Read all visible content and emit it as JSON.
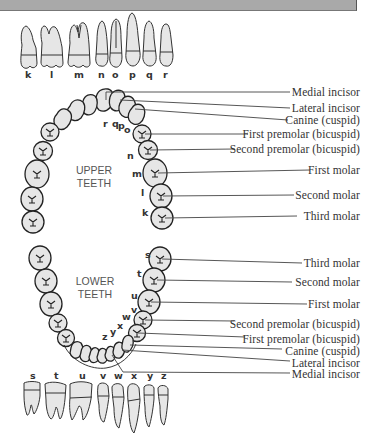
{
  "header": {
    "bar_color": "#a9a9a9"
  },
  "upper": {
    "title_line1": "UPPER",
    "title_line2": "TEETH",
    "row_letters": [
      "k",
      "l",
      "m",
      "n",
      "o",
      "p",
      "q",
      "r"
    ],
    "arch_letters": [
      "r",
      "q",
      "p",
      "o",
      "n",
      "m",
      "l",
      "k"
    ],
    "labels": [
      {
        "text": "Medial incisor",
        "y": 86
      },
      {
        "text": "Lateral incisor",
        "y": 102
      },
      {
        "text": "Canine (cuspid)",
        "y": 114
      },
      {
        "text": "First premolar (bicuspid)",
        "y": 128
      },
      {
        "text": "Second premolar (bicuspid)",
        "y": 143
      },
      {
        "text": "First molar",
        "y": 164
      },
      {
        "text": "Second molar",
        "y": 189
      },
      {
        "text": "Third molar",
        "y": 210
      }
    ]
  },
  "lower": {
    "title_line1": "LOWER",
    "title_line2": "TEETH",
    "row_letters": [
      "s",
      "t",
      "u",
      "v",
      "w",
      "x",
      "y",
      "z"
    ],
    "arch_letters": [
      "s",
      "t",
      "u",
      "v",
      "w",
      "x",
      "y",
      "z"
    ],
    "labels": [
      {
        "text": "Third molar",
        "y": 257
      },
      {
        "text": "Second molar",
        "y": 276
      },
      {
        "text": "First molar",
        "y": 298
      },
      {
        "text": "Second premolar (bicuspid)",
        "y": 318
      },
      {
        "text": "First premolar (bicuspid)",
        "y": 333
      },
      {
        "text": "Canine (cuspid)",
        "y": 345
      },
      {
        "text": "Lateral incisor",
        "y": 357
      },
      {
        "text": "Medial incisor",
        "y": 368
      }
    ]
  },
  "colors": {
    "tooth_fill": "#e6e6e6",
    "outline": "#222222",
    "leader": "#444444"
  }
}
